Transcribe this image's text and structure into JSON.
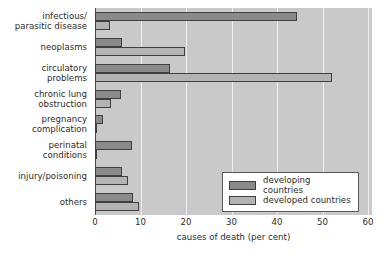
{
  "chart_data": {
    "type": "bar",
    "orientation": "horizontal",
    "title": "",
    "xlabel": "causes of death (per cent)",
    "ylabel": "",
    "xlim": [
      0,
      60
    ],
    "xticks": [
      0,
      10,
      20,
      30,
      40,
      50,
      60
    ],
    "grid": true,
    "legend_position": "bottom-right",
    "categories": [
      "infectious/\nparasitic disease",
      "neoplasms",
      "circulatory\nproblems",
      "chronic lung\nobstruction",
      "pregnancy\ncomplication",
      "perinatal\nconditions",
      "injury/poisoning",
      "others"
    ],
    "series": [
      {
        "name": "developing countries",
        "color": "#8a8a8a",
        "values": [
          44.3,
          6.0,
          16.5,
          5.7,
          1.8,
          8.1,
          5.9,
          8.4
        ]
      },
      {
        "name": "developed countries",
        "color": "#b3b3b3",
        "values": [
          3.3,
          19.8,
          52.0,
          3.5,
          0.4,
          0.5,
          7.3,
          9.7
        ]
      }
    ]
  },
  "axis": {
    "x_title_main": "causes of death",
    "x_title_unit": "(per cent)",
    "tick_labels": [
      "0",
      "10",
      "20",
      "30",
      "40",
      "50",
      "60"
    ]
  },
  "legend": {
    "items": [
      {
        "label": "developing countries",
        "swatch": "developing"
      },
      {
        "label": "developed countries",
        "swatch": "developed"
      }
    ]
  },
  "colors": {
    "plot_background": "#c9c9c9",
    "gridline": "#efefef",
    "axis": "#4a4a4a",
    "developing": "#8a8a8a",
    "developed": "#b3b3b3",
    "bar_outline": "#3f3f3f",
    "text": "#2b2b2b",
    "page_background": "#ffffff"
  }
}
